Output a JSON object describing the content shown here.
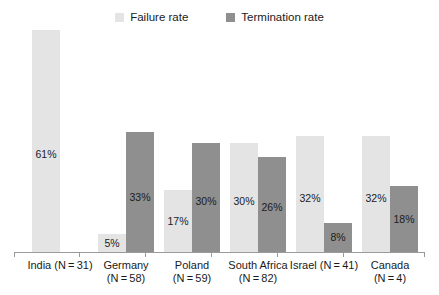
{
  "legend": {
    "position": "top-center",
    "items": [
      {
        "label": "Failure rate",
        "color": "#e4e4e4",
        "icon": "square-swatch"
      },
      {
        "label": "Termination rate",
        "color": "#8f8f8f",
        "icon": "square-swatch"
      }
    ]
  },
  "axis": {
    "show_x_line": true,
    "show_y_axis": false,
    "grid": false,
    "ymax_percent": 65
  },
  "chart_data": {
    "type": "bar",
    "title": "",
    "subtitle": "",
    "xlabel": "",
    "ylabel": "",
    "ylim": [
      0,
      65
    ],
    "value_suffix": "%",
    "grid": false,
    "legend_position": "top-center",
    "categories": [
      "India (N = 31)",
      "Germany (N = 58)",
      "Poland (N = 59)",
      "South Africa (N = 82)",
      "Israel (N = 41)",
      "Canada (N = 4)"
    ],
    "category_lines": [
      [
        "India (N = 31)",
        ""
      ],
      [
        "Germany",
        "(N = 58)"
      ],
      [
        "Poland",
        "(N = 59)"
      ],
      [
        "South Africa",
        "(N = 82)"
      ],
      [
        "Israel (N = 41)",
        ""
      ],
      [
        "Canada",
        "(N = 4)"
      ]
    ],
    "series": [
      {
        "name": "Failure rate",
        "color": "#e4e4e4",
        "values": [
          61,
          5,
          17,
          30,
          32,
          32
        ],
        "labels": [
          "61%",
          "5%",
          "17%",
          "30%",
          "32%",
          "32%"
        ]
      },
      {
        "name": "Termination rate",
        "color": "#8f8f8f",
        "values": [
          null,
          33,
          30,
          26,
          8,
          18
        ],
        "labels": [
          "",
          "33%",
          "30%",
          "26%",
          "8%",
          "18%"
        ]
      }
    ]
  }
}
